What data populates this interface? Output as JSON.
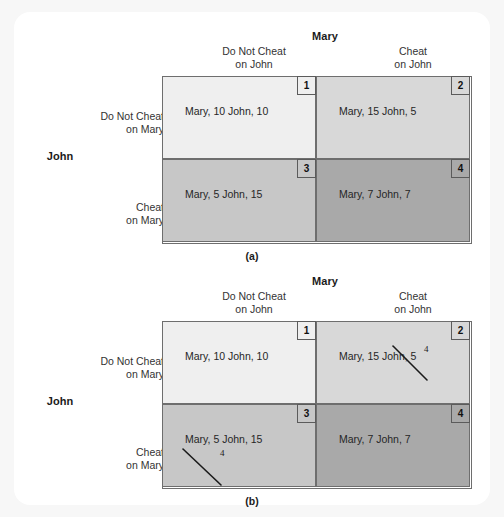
{
  "figure": {
    "column_player": "Mary",
    "row_player": "John",
    "column_strategies": [
      {
        "line1": "Do Not Cheat",
        "line2": "on John"
      },
      {
        "line1": "Cheat",
        "line2": "on John"
      }
    ],
    "row_strategies": [
      {
        "line1": "Do Not Cheat",
        "line2": "on Mary"
      },
      {
        "line1": "Cheat",
        "line2": "on Mary"
      }
    ],
    "colors": {
      "cell1": "#efefef",
      "cell2": "#d8d8d8",
      "cell3": "#c7c7c7",
      "cell4": "#a9a9a9",
      "border": "#6e6e6e",
      "card": "#ffffff",
      "page": "#f7f7f7",
      "ink": "#1a1a1a"
    },
    "panels": [
      {
        "caption": "(a)",
        "cells": [
          {
            "number": "1",
            "mary": "Mary, 10",
            "john": "John, 10",
            "annotated": false
          },
          {
            "number": "2",
            "mary": "Mary, 15",
            "john": "John, 5",
            "annotated": false
          },
          {
            "number": "3",
            "mary": "Mary, 5",
            "john": "John, 15",
            "annotated": false
          },
          {
            "number": "4",
            "mary": "Mary, 7",
            "john": "John, 7",
            "annotated": false
          }
        ]
      },
      {
        "caption": "(b)",
        "cells": [
          {
            "number": "1",
            "mary": "Mary, 10",
            "john": "John, 10",
            "annotated": false
          },
          {
            "number": "2",
            "mary": "Mary, 15",
            "john": "John, 5",
            "annotated": true,
            "annotation": {
              "target": "mary",
              "crossed_out": "15",
              "handwritten": "4"
            }
          },
          {
            "number": "3",
            "mary": "Mary, 5",
            "john": "John, 15",
            "annotated": true,
            "annotation": {
              "target": "john",
              "crossed_out": "15",
              "handwritten": "4"
            }
          },
          {
            "number": "4",
            "mary": "Mary, 7",
            "john": "John, 7",
            "annotated": false
          }
        ]
      }
    ]
  }
}
